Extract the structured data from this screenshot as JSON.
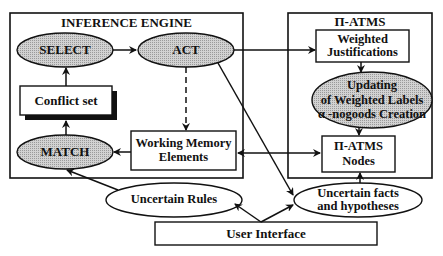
{
  "inference_engine": {
    "title": "INFERENCE ENGINE",
    "select": "SELECT",
    "act": "ACT",
    "conflict_set": "Conflict set",
    "match": "MATCH",
    "working_memory_line1": "Working Memory",
    "working_memory_line2": "Elements"
  },
  "atms": {
    "title": "Π-ATMS",
    "weighted_justifications_line1": "Weighted",
    "weighted_justifications_line2": "Justifications",
    "updating_line1": "Updating",
    "updating_line2": "of Weighted Labels",
    "updating_line3": "α  -nogoods Creation",
    "nodes_line1": "Π-ATMS",
    "nodes_line2": "Nodes"
  },
  "external": {
    "uncertain_rules": "Uncertain Rules",
    "uncertain_facts_line1": "Uncertain facts",
    "uncertain_facts_line2": "and hypotheses",
    "user_interface": "User Interface"
  },
  "colors": {
    "ellipse_fill": "#c8c8c8",
    "stroke": "#111111",
    "background": "#ffffff"
  }
}
